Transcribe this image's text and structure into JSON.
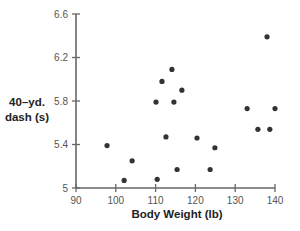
{
  "chart_data": {
    "type": "scatter",
    "title": "",
    "xlabel": "Body Weight (lb)",
    "ylabel_lines": [
      "40–yd.",
      "dash (s)"
    ],
    "ylabel": "40–yd. dash (s)",
    "xlim": [
      90,
      140
    ],
    "ylim": [
      5,
      6.6
    ],
    "xticks": [
      90,
      100,
      110,
      120,
      130,
      140
    ],
    "xtick_labels": [
      "90",
      "100",
      "110",
      "120",
      "130",
      "140"
    ],
    "yticks": [
      5,
      5.4,
      5.8,
      6.2,
      6.6
    ],
    "ytick_labels": [
      "5",
      "5.4",
      "5.8",
      "6.2",
      "6.6"
    ],
    "grid": false,
    "legend": null,
    "point_color": "#333333",
    "axis_color": "#666666",
    "points": [
      {
        "x": 97.8,
        "y": 5.39
      },
      {
        "x": 102.1,
        "y": 5.07
      },
      {
        "x": 104.1,
        "y": 5.25
      },
      {
        "x": 110.1,
        "y": 5.79
      },
      {
        "x": 110.4,
        "y": 5.08
      },
      {
        "x": 111.6,
        "y": 5.98
      },
      {
        "x": 112.6,
        "y": 5.47
      },
      {
        "x": 114.1,
        "y": 6.09
      },
      {
        "x": 114.6,
        "y": 5.79
      },
      {
        "x": 115.4,
        "y": 5.17
      },
      {
        "x": 116.6,
        "y": 5.9
      },
      {
        "x": 120.4,
        "y": 5.46
      },
      {
        "x": 123.7,
        "y": 5.17
      },
      {
        "x": 124.9,
        "y": 5.37
      },
      {
        "x": 133.0,
        "y": 5.73
      },
      {
        "x": 135.7,
        "y": 5.54
      },
      {
        "x": 138.0,
        "y": 6.39
      },
      {
        "x": 138.7,
        "y": 5.54
      },
      {
        "x": 140.0,
        "y": 5.73
      }
    ]
  }
}
